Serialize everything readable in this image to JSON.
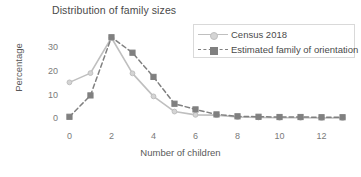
{
  "chart_data": {
    "type": "line",
    "title": "Distribution of family sizes",
    "xlabel": "Number of children",
    "ylabel": "Percentage",
    "x": [
      0,
      1,
      2,
      3,
      4,
      5,
      6,
      7,
      8,
      9,
      10,
      11,
      12,
      13
    ],
    "xlim": [
      -0.45,
      13.45
    ],
    "ylim": [
      -1.5,
      36
    ],
    "xticks": [
      0,
      2,
      4,
      6,
      8,
      10,
      12
    ],
    "xtick_labels": [
      "0",
      "2",
      "4",
      "6",
      "8",
      "10",
      "12"
    ],
    "yticks": [
      0,
      10,
      20,
      30
    ],
    "ytick_labels": [
      "0",
      "10",
      "20",
      "30"
    ],
    "grid": false,
    "legend_position": "upper right",
    "series": [
      {
        "name": "Census 2018",
        "color": "#bfbfbf",
        "linestyle": "solid",
        "marker": "circle",
        "values": [
          15.2,
          19.1,
          34.0,
          19.0,
          9.3,
          2.9,
          1.5,
          1.4,
          0.6,
          0.4,
          0.3,
          0.3,
          0.2,
          0.2
        ]
      },
      {
        "name": "Estimated family of orientation",
        "color": "#808080",
        "linestyle": "dashed",
        "marker": "square",
        "values": [
          0.7,
          9.7,
          34.2,
          27.7,
          17.5,
          6.2,
          3.8,
          1.7,
          0.9,
          0.7,
          0.6,
          0.6,
          0.5,
          0.5
        ]
      }
    ]
  },
  "legend": {
    "items": [
      {
        "label": "Census 2018"
      },
      {
        "label": "Estimated family of orientation"
      }
    ]
  }
}
